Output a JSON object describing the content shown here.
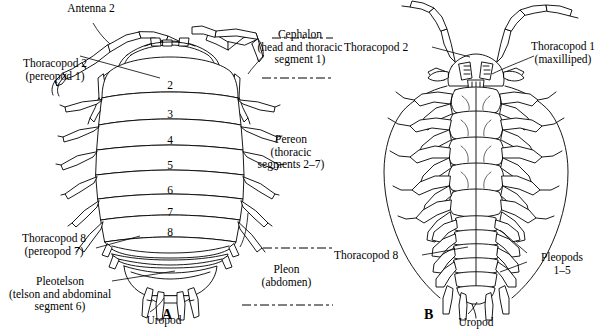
{
  "figure": {
    "title_caption": "",
    "panels": [
      {
        "id": "A",
        "letter": "A",
        "view": "dorsal"
      },
      {
        "id": "B",
        "letter": "B",
        "view": "ventral"
      }
    ]
  },
  "panelA": {
    "letter": "A",
    "labels": {
      "antenna2": "Antenna 2",
      "thoracopod2": "Thoracopod 2\n(pereopod 1)",
      "cephalon": "Cephalon\n(head and thoracic\nsegment 1)",
      "pereon": "Pereon\n(thoracic\nsegments 2–7)",
      "thoracopod8": "Thoracopod 8\n(pereopod 7)",
      "pleotelson": "Pleotelson\n(telson and abdominal\nsegment 6)",
      "pleon": "Pleon\n(abdomen)",
      "uropod": "Uropod"
    },
    "segment_numbers": [
      "2",
      "3",
      "4",
      "5",
      "6",
      "7",
      "8"
    ]
  },
  "panelB": {
    "letter": "B",
    "labels": {
      "thoracopod2": "Thoracopod 2",
      "thoracopod1": "Thoracopod 1\n(maxilliped)",
      "thoracopod8": "Thoracopod 8",
      "pleopods": "Pleopods\n1–5",
      "uropod": "Uropod"
    }
  },
  "colors": {
    "ink": "#000000",
    "background": "#ffffff"
  }
}
